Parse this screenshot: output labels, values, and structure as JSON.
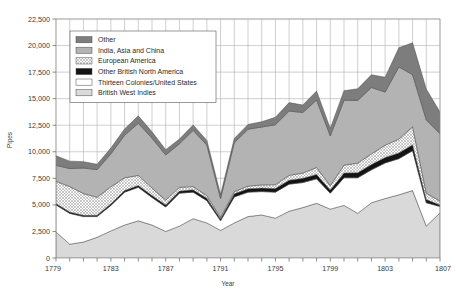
{
  "chart_data": {
    "type": "area",
    "title": "",
    "xlabel": "Year",
    "ylabel": "Pipes",
    "xlim": [
      1779,
      1807
    ],
    "ylim": [
      0,
      22500
    ],
    "ytick_labels": [
      "0",
      "2,500",
      "5,000",
      "7,500",
      "10,000",
      "12,500",
      "15,000",
      "17,500",
      "20,000",
      "22,500"
    ],
    "ytick_values": [
      0,
      2500,
      5000,
      7500,
      10000,
      12500,
      15000,
      17500,
      20000,
      22500
    ],
    "xtick_labels": [
      "1779",
      "1783",
      "1787",
      "1791",
      "1795",
      "1799",
      "1803",
      "1807"
    ],
    "xtick_values": [
      1779,
      1783,
      1787,
      1791,
      1795,
      1799,
      1803,
      1807
    ],
    "grid": true,
    "stacked": true,
    "legend_position": "top-left",
    "x": [
      1779,
      1780,
      1781,
      1782,
      1783,
      1784,
      1785,
      1786,
      1787,
      1788,
      1789,
      1790,
      1791,
      1792,
      1793,
      1794,
      1795,
      1796,
      1797,
      1798,
      1799,
      1800,
      1801,
      1802,
      1803,
      1804,
      1805,
      1806,
      1807
    ],
    "series": [
      {
        "name": "British West Indies",
        "color": "#d9d9d9",
        "pattern": "solid",
        "values": [
          2450,
          1300,
          1500,
          1950,
          2550,
          3100,
          3500,
          3100,
          2500,
          3000,
          3700,
          3300,
          2600,
          3300,
          3900,
          4050,
          3750,
          4400,
          4750,
          5150,
          4600,
          4950,
          4200,
          5200,
          5600,
          5950,
          6350,
          3000,
          4250
        ]
      },
      {
        "name": "Thirteen Colonies/United States",
        "color": "#ffffff",
        "pattern": "solid",
        "values": [
          2550,
          2900,
          2400,
          1950,
          2400,
          3100,
          3150,
          2600,
          2300,
          3100,
          2500,
          2100,
          900,
          2450,
          2300,
          2200,
          2450,
          2550,
          2350,
          2300,
          1500,
          2600,
          3350,
          3100,
          3350,
          3400,
          3750,
          2200,
          600
        ]
      },
      {
        "name": "Other British North America",
        "color": "#141414",
        "pattern": "solid",
        "values": [
          120,
          120,
          120,
          120,
          150,
          150,
          180,
          180,
          200,
          200,
          220,
          220,
          160,
          300,
          320,
          330,
          350,
          380,
          400,
          420,
          300,
          450,
          480,
          500,
          520,
          540,
          560,
          300,
          150
        ]
      },
      {
        "name": "European America",
        "color": "#e8e8e8",
        "pattern": "crosshatch",
        "values": [
          2100,
          2400,
          2050,
          1700,
          1600,
          1200,
          950,
          700,
          450,
          350,
          300,
          250,
          150,
          200,
          250,
          300,
          350,
          450,
          500,
          650,
          400,
          750,
          900,
          1000,
          1150,
          1300,
          1700,
          600,
          350
        ]
      },
      {
        "name": "India, Asia and China",
        "color": "#b3b3b3",
        "pattern": "solid",
        "values": [
          1500,
          1700,
          2400,
          2600,
          3100,
          4000,
          4900,
          4700,
          4250,
          4100,
          5300,
          4750,
          1800,
          4600,
          5350,
          5450,
          5650,
          6050,
          5700,
          6350,
          4700,
          6100,
          5900,
          6250,
          5000,
          6800,
          4900,
          6900,
          6350
        ]
      },
      {
        "name": "Other",
        "color": "#7d7d7d",
        "pattern": "solid",
        "values": [
          900,
          700,
          600,
          500,
          550,
          600,
          700,
          600,
          500,
          450,
          500,
          450,
          350,
          400,
          450,
          500,
          700,
          800,
          700,
          850,
          700,
          900,
          1100,
          1200,
          1400,
          1800,
          3000,
          2900,
          2050
        ]
      }
    ]
  },
  "legend": {
    "items": [
      {
        "label": "Other",
        "swatch": "other-swatch"
      },
      {
        "label": "India, Asia and China",
        "swatch": "india-asia-china-swatch"
      },
      {
        "label": "European America",
        "swatch": "european-america-swatch"
      },
      {
        "label": "Other British North America",
        "swatch": "other-british-north-america-swatch"
      },
      {
        "label": "Thirteen Colonies/United States",
        "swatch": "thirteen-colonies-united-states-swatch"
      },
      {
        "label": "British West Indies",
        "swatch": "british-west-indies-swatch"
      }
    ]
  }
}
